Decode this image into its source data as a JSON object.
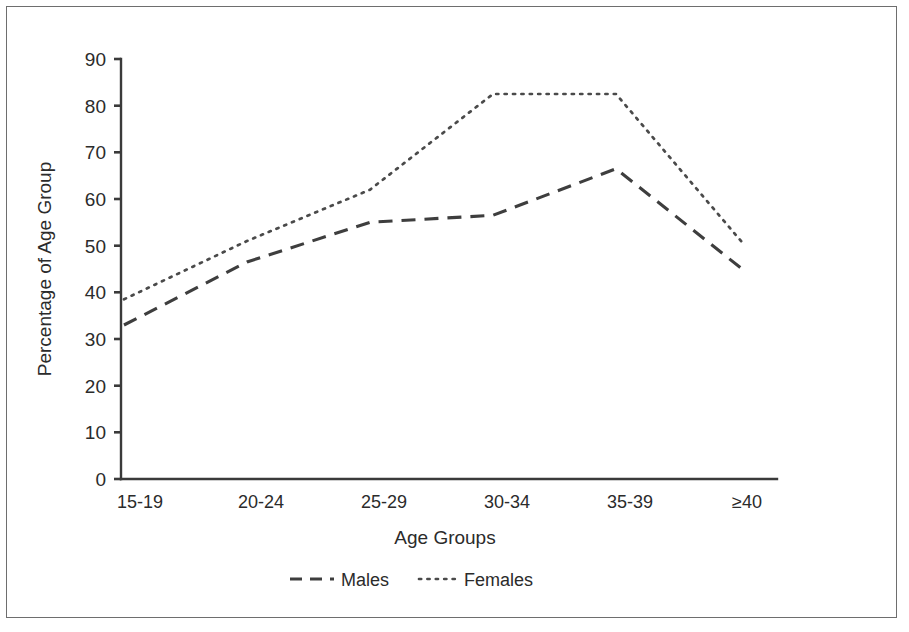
{
  "chart_data": {
    "type": "line",
    "title": "",
    "xlabel": "Age Groups",
    "ylabel": "Percentage of Age Group",
    "categories": [
      "15-19",
      "20-24",
      "25-29",
      "30-34",
      "35-39",
      "≥40"
    ],
    "series": [
      {
        "name": "Males",
        "values": [
          33,
          46.5,
          55,
          56.5,
          66.5,
          44.5
        ],
        "style": "dashed"
      },
      {
        "name": "Females",
        "values": [
          38.5,
          51,
          62,
          82.5,
          82.5,
          50
        ]
      }
    ],
    "ylim": [
      0,
      90
    ],
    "yticks": [
      0,
      10,
      20,
      30,
      40,
      50,
      60,
      70,
      80,
      90
    ],
    "grid": false,
    "legend_position": "bottom"
  },
  "axes": {
    "y_title": "Percentage of Age Group",
    "x_title": "Age Groups",
    "y_tick_labels": [
      "90",
      "80",
      "70",
      "60",
      "50",
      "40",
      "30",
      "20",
      "10",
      "0"
    ],
    "x_tick_labels": [
      "15-19",
      "20-24",
      "25-29",
      "30-34",
      "35-39",
      "≥40"
    ]
  },
  "legend": {
    "entries": [
      {
        "label": "Males",
        "style": "dashed"
      },
      {
        "label": "Females",
        "style": "dotted"
      }
    ]
  },
  "colors": {
    "males_line": "#3e3e3e",
    "females_line": "#4a4a4a",
    "axis": "#3a3a3a",
    "text": "#2b2b2b",
    "frame": "#6e6e6e",
    "background": "#ffffff"
  }
}
